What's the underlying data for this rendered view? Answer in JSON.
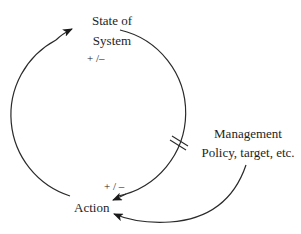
{
  "diagram": {
    "type": "causal-loop",
    "nodes": {
      "state": {
        "line1": "State of",
        "line2": "System"
      },
      "action": {
        "label": "Action"
      },
      "management": {
        "line1": "Management",
        "line2": "Policy, target, etc."
      }
    },
    "polarities": {
      "action_to_state": "+ /–",
      "state_to_action": "+ / –"
    },
    "links": [
      {
        "from": "Action",
        "to": "State of System",
        "polarity": "+ /–"
      },
      {
        "from": "State of System",
        "to": "Action",
        "polarity": "+ / –",
        "delay": true
      },
      {
        "from": "Management Policy, target, etc.",
        "to": "Action"
      }
    ],
    "colors": {
      "stroke": "#2a2a2a",
      "text": "#1e1e1e",
      "background": "#ffffff"
    }
  }
}
